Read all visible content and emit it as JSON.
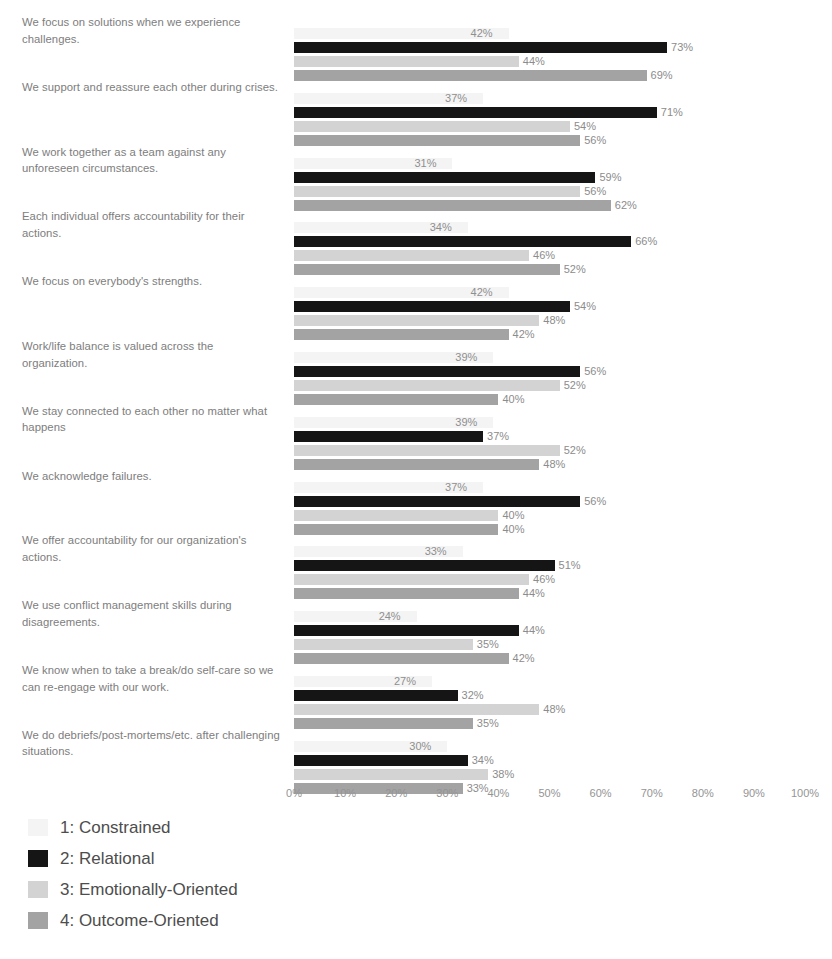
{
  "chart_data": {
    "type": "bar",
    "orientation": "horizontal",
    "grouped": true,
    "title": "",
    "subtitle": "",
    "xlabel": "",
    "ylabel": "",
    "xlim": [
      0,
      100
    ],
    "xtick_labels": [
      "0%",
      "10%",
      "20%",
      "30%",
      "40%",
      "50%",
      "60%",
      "70%",
      "80%",
      "90%",
      "100%"
    ],
    "xticks": [
      0,
      10,
      20,
      30,
      40,
      50,
      60,
      70,
      80,
      90,
      100
    ],
    "grid": false,
    "value_label_suffix": "%",
    "legend_position": "bottom-left",
    "categories": [
      "We focus on solutions when we experience challenges.",
      "We support and reassure each other during crises.",
      "We work together as a team against any unforeseen circumstances.",
      "Each individual offers accountability for their actions.",
      "We focus on everybody's strengths.",
      "Work/life balance is valued across the organization.",
      "We stay connected to each other no matter what happens",
      "We acknowledge failures.",
      "We offer accountability for our organization's actions.",
      "We use conflict management skills during disagreements.",
      "We know when to take a break/do self-care so we can re-engage with our work.",
      "We do debriefs/post-mortems/etc. after challenging situations."
    ],
    "series": [
      {
        "name": "1: Constrained",
        "color": "#f4f4f4",
        "values": [
          42,
          37,
          31,
          34,
          42,
          39,
          39,
          37,
          33,
          24,
          27,
          30
        ],
        "labels": [
          "42%",
          "37%",
          "31%",
          "34%",
          "42%",
          "39%",
          "39%",
          "37%",
          "33%",
          "24%",
          "27%",
          "30%"
        ]
      },
      {
        "name": "2: Relational",
        "color": "#151515",
        "values": [
          73,
          71,
          59,
          66,
          54,
          56,
          37,
          56,
          51,
          44,
          32,
          34
        ],
        "labels": [
          "73%",
          "71%",
          "59%",
          "66%",
          "54%",
          "56%",
          "37%",
          "56%",
          "51%",
          "44%",
          "32%",
          "34%"
        ]
      },
      {
        "name": "3: Emotionally-Oriented",
        "color": "#d3d3d3",
        "values": [
          44,
          54,
          56,
          46,
          48,
          52,
          52,
          40,
          46,
          35,
          48,
          38
        ],
        "labels": [
          "44%",
          "54%",
          "56%",
          "46%",
          "48%",
          "52%",
          "52%",
          "40%",
          "46%",
          "35%",
          "48%",
          "38%"
        ]
      },
      {
        "name": "4: Outcome-Oriented",
        "color": "#a3a3a3",
        "values": [
          69,
          56,
          62,
          52,
          42,
          40,
          48,
          40,
          44,
          42,
          35,
          33
        ],
        "labels": [
          "69%",
          "56%",
          "62%",
          "52%",
          "42%",
          "40%",
          "48%",
          "40%",
          "44%",
          "42%",
          "35%",
          "33%"
        ]
      }
    ]
  },
  "legend": {
    "items": [
      {
        "label": "1: Constrained",
        "color": "#f4f4f4"
      },
      {
        "label": "2: Relational",
        "color": "#151515"
      },
      {
        "label": "3: Emotionally-Oriented",
        "color": "#d3d3d3"
      },
      {
        "label": "4: Outcome-Oriented",
        "color": "#a3a3a3"
      }
    ]
  }
}
